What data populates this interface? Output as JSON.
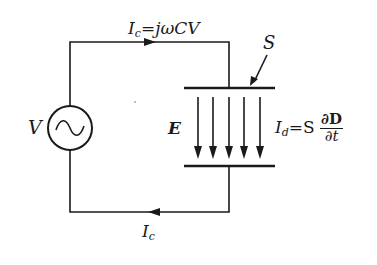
{
  "diagram": {
    "source": {
      "label": "V",
      "symbol": "ac-sine"
    },
    "top_current": {
      "symbol": "I",
      "sub": "c",
      "eq": "=jωCV"
    },
    "bottom_current": {
      "symbol": "I",
      "sub": "c"
    },
    "surface_label": "S",
    "field_label": "E",
    "displacement": {
      "symbol": "I",
      "sub": "d",
      "eq": "=S",
      "num": "∂D",
      "den": "∂t"
    },
    "field_arrow_count": 5,
    "colors": {
      "line": "#1a1a1a",
      "background": "#ffffff"
    }
  }
}
